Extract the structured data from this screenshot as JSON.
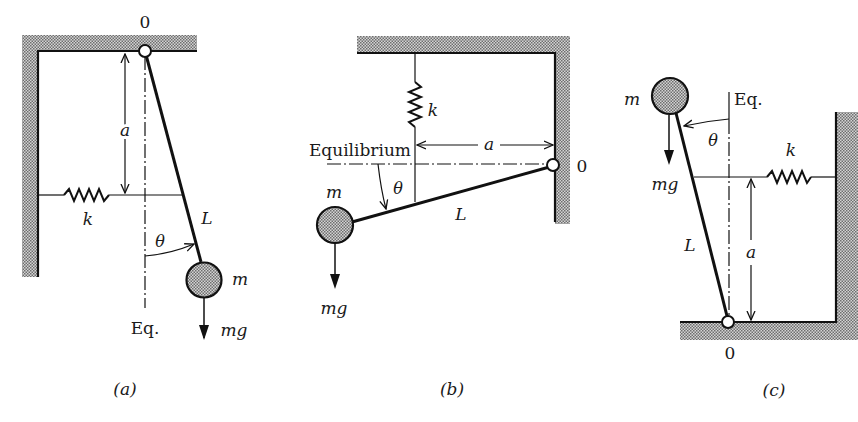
{
  "figures": [
    {
      "id": "a",
      "caption": "(a)",
      "labels": {
        "pivot": "0",
        "spring": "k",
        "distance": "a",
        "length": "L",
        "angle": "θ",
        "mass": "m",
        "weight": "mg",
        "equilibrium": "Eq."
      }
    },
    {
      "id": "b",
      "caption": "(b)",
      "labels": {
        "pivot": "0",
        "spring": "k",
        "distance": "a",
        "length": "L",
        "angle": "θ",
        "mass": "m",
        "weight": "mg",
        "equilibrium": "Equilibrium"
      }
    },
    {
      "id": "c",
      "caption": "(c)",
      "labels": {
        "pivot": "0",
        "spring": "k",
        "distance": "a",
        "length": "L",
        "angle": "θ",
        "mass": "m",
        "weight": "mg",
        "equilibrium": "Eq."
      }
    }
  ],
  "colors": {
    "ink": "#111111",
    "hatch": "#8a8a8a",
    "background": "#ffffff"
  }
}
